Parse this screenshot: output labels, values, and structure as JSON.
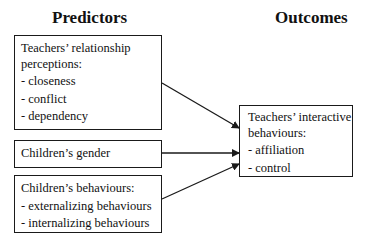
{
  "headings": {
    "predictors": "Predictors",
    "outcomes": "Outcomes"
  },
  "predictors": [
    {
      "title_lines": [
        "Teachers’ relationship",
        "perceptions:"
      ],
      "items": [
        "- closeness",
        "- conflict",
        "- dependency"
      ]
    },
    {
      "title_lines": [
        "Children’s gender"
      ],
      "items": []
    },
    {
      "title_lines": [
        "Children’s behaviours:"
      ],
      "items": [
        "- externalizing behaviours",
        "- internalizing behaviours"
      ]
    }
  ],
  "outcome": {
    "title_lines": [
      "Teachers’ interactive",
      "behaviours:"
    ],
    "items": [
      "- affiliation",
      "- control"
    ]
  },
  "arrows": [
    {
      "from": "predictor-relationship-perceptions",
      "to": "outcome-interactive-behaviours"
    },
    {
      "from": "predictor-childrens-gender",
      "to": "outcome-interactive-behaviours"
    },
    {
      "from": "predictor-childrens-behaviours",
      "to": "outcome-interactive-behaviours"
    }
  ],
  "colors": {
    "stroke": "#1a1a1a",
    "background": "#ffffff"
  }
}
